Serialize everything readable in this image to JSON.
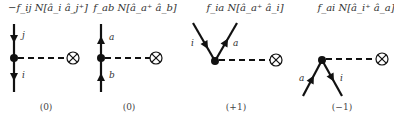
{
  "diagrams": [
    {
      "title": "−f_ij N[â_i â_j⁺]",
      "title_parts": {
        "prefix": "−f",
        "sub": "ij",
        "mid": "N[â",
        "op1_sub": "i",
        "op2": "â",
        "op2_sub": "j",
        "op2_sup": "+",
        "end": "]"
      },
      "line_labels": [
        "j",
        "i"
      ],
      "excitation_level": "(0)"
    },
    {
      "title": "f_ab N[â_a⁺ â_b]",
      "line_labels": [
        "a",
        "b"
      ],
      "excitation_level": "(0)"
    },
    {
      "title": "f_ia N[â_a⁺ â_i]",
      "line_labels": [
        "i",
        "a"
      ],
      "excitation_level": "(+1)"
    },
    {
      "title": "f_ai N[â_i⁺ â_a]",
      "line_labels": [
        "a",
        "i"
      ],
      "excitation_level": "(−1)"
    }
  ],
  "colors": {
    "line": "#111111",
    "text": "#333333",
    "background": "#ffffff"
  }
}
